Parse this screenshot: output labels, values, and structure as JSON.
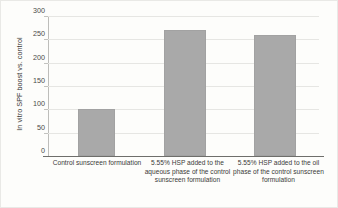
{
  "chart_data": {
    "type": "bar",
    "title": "",
    "xlabel": "",
    "ylabel": "In vitro SPF boost vs. control",
    "ylim": [
      0,
      300
    ],
    "ytick_labels": [
      "300",
      "250",
      "200",
      "150",
      "100",
      "50",
      "0"
    ],
    "ytick_values": [
      300,
      250,
      200,
      150,
      100,
      50,
      0
    ],
    "grid": true,
    "legend": false,
    "bar_color": "#a9a9a9",
    "categories": [
      "Control sunscreen formulation",
      "5.55% HSP added to the aqueous phase of the control sunscreen formulation",
      "5.55% HSP added to the oil phase of the control sunscreen formulation"
    ],
    "values": [
      100,
      270,
      260
    ],
    "series": [
      {
        "name": "In vitro SPF boost vs. control",
        "values": [
          100,
          270,
          260
        ]
      }
    ]
  },
  "axis": {
    "y_title": "In vitro SPF boost vs. control"
  },
  "ticks": {
    "t0": "300",
    "t1": "250",
    "t2": "200",
    "t3": "150",
    "t4": "100",
    "t5": "50",
    "t6": "0"
  },
  "categories": {
    "c0": "Control sunscreen formulation",
    "c1": "5.55% HSP added to the aqueous phase of the control sunscreen formulation",
    "c2": "5.55% HSP added to the oil phase of the control sunscreen formulation"
  }
}
